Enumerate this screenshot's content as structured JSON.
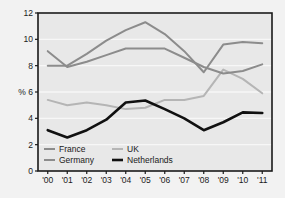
{
  "figure": {
    "background_color": "#f2f2f2",
    "plot_background_color": "#e8e8e8",
    "frame_color": "#1a1a1a",
    "gridline_color": "#f7f7f7"
  },
  "chart_data": {
    "type": "line",
    "title": "",
    "xlabel": "",
    "ylabel": "%",
    "x": [
      "'00",
      "'01",
      "'02",
      "'03",
      "'04",
      "'05",
      "'06",
      "'07",
      "'08",
      "'09",
      "'10",
      "'11"
    ],
    "xtick_labels": [
      "'00",
      "'01",
      "'02",
      "'03",
      "'04",
      "'05",
      "'06",
      "'07",
      "'08",
      "'09",
      "'10",
      "'11"
    ],
    "ytick_labels": [
      "0",
      "2",
      "4",
      "6",
      "8",
      "10",
      "12"
    ],
    "yticks": [
      0,
      2,
      4,
      6,
      8,
      10,
      12
    ],
    "ylim": [
      0,
      12
    ],
    "grid": true,
    "legend_position": "lower-left-inside",
    "series": [
      {
        "name": "France",
        "color": "#8c8c8c",
        "width": 2.0,
        "values": [
          9.1,
          7.9,
          8.3,
          8.8,
          9.3,
          9.3,
          9.3,
          8.6,
          7.9,
          7.4,
          7.6,
          8.1
        ]
      },
      {
        "name": "Germany",
        "color": "#8c8c8c",
        "width": 2.0,
        "values": [
          8.0,
          8.0,
          8.9,
          9.9,
          10.7,
          11.3,
          10.4,
          9.1,
          7.5,
          9.6,
          9.8,
          9.7
        ]
      },
      {
        "name": "UK",
        "color": "#b5b5b5",
        "width": 2.0,
        "values": [
          5.4,
          5.0,
          5.2,
          5.0,
          4.7,
          4.8,
          5.4,
          5.4,
          5.7,
          7.7,
          7.0,
          5.9
        ]
      },
      {
        "name": "Netherlands",
        "color": "#111111",
        "width": 2.6,
        "values": [
          3.1,
          2.55,
          3.1,
          3.9,
          5.2,
          5.35,
          4.7,
          4.0,
          3.1,
          3.7,
          4.45,
          4.4
        ]
      }
    ]
  },
  "legend": {
    "entries": [
      {
        "label": "France",
        "color": "#8c8c8c"
      },
      {
        "label": "UK",
        "color": "#b5b5b5"
      },
      {
        "label": "Germany",
        "color": "#8c8c8c"
      },
      {
        "label": "Netherlands",
        "color": "#111111"
      }
    ]
  }
}
